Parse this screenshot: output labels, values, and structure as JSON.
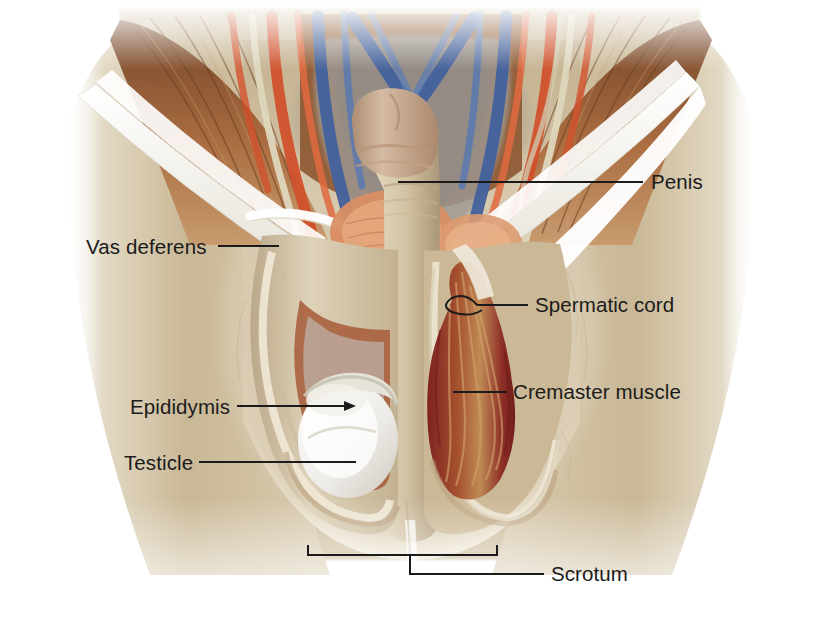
{
  "illustration": {
    "title": "Male external genitalia and inguinal region dissection",
    "subject": "Anterior view of the groin showing penis, scrotum and spermatic cord structures",
    "background_color": "#ffffff",
    "skin_color": "#cfbfa2",
    "muscle_color": "#8a5430",
    "artery_color": "#d1512c",
    "vein_color": "#42619c",
    "fascia_color": "#f6f4ee",
    "cremaster_color": "#8e2b28",
    "testicle_color": "#f2f1ef",
    "leader_color": "#1b1b1b"
  },
  "labels": [
    {
      "id": "penis",
      "text": "Penis",
      "text_x": 651,
      "text_y": 172,
      "leader": {
        "type": "line",
        "x1": 398,
        "y1": 182,
        "x2": 643,
        "y2": 182
      },
      "marker": "none"
    },
    {
      "id": "vas-deferens",
      "text": "Vas deferens",
      "text_x": 86,
      "text_y": 237,
      "leader": {
        "type": "line",
        "x1": 218,
        "y1": 246,
        "x2": 279,
        "y2": 246
      },
      "marker": "none"
    },
    {
      "id": "spermatic-cord",
      "text": "Spermatic cord",
      "text_x": 535,
      "text_y": 295,
      "leader": {
        "type": "line",
        "x1": 477,
        "y1": 305,
        "x2": 528,
        "y2": 305
      },
      "marker": "hook"
    },
    {
      "id": "cremaster-muscle",
      "text": "Cremaster muscle",
      "text_x": 513,
      "text_y": 382,
      "leader": {
        "type": "line",
        "x1": 453,
        "y1": 392,
        "x2": 507,
        "y2": 392
      },
      "marker": "none"
    },
    {
      "id": "epididymis",
      "text": "Epididymis",
      "text_x": 130,
      "text_y": 397,
      "leader": {
        "type": "line",
        "x1": 237,
        "y1": 406,
        "x2": 353,
        "y2": 406
      },
      "marker": "arrow"
    },
    {
      "id": "testicle",
      "text": "Testicle",
      "text_x": 124,
      "text_y": 453,
      "leader": {
        "type": "line",
        "x1": 199,
        "y1": 462,
        "x2": 356,
        "y2": 462
      },
      "marker": "none"
    },
    {
      "id": "scrotum",
      "text": "Scrotum",
      "text_x": 551,
      "text_y": 564,
      "leader": {
        "type": "bracket",
        "x1": 308,
        "x2": 497,
        "y": 555,
        "tick": 10,
        "stem_x": 410,
        "stem_y": 574,
        "x_end": 544
      },
      "marker": "none"
    }
  ]
}
